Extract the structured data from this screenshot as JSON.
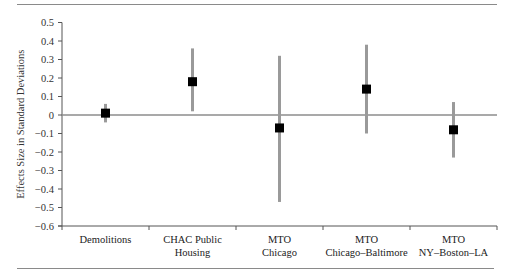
{
  "chart_data": {
    "type": "scatter",
    "subtype": "point-with-error-bars",
    "title": "",
    "xlabel": "",
    "ylabel": "Effects Size in Standard Deviations",
    "ylim": [
      -0.6,
      0.5
    ],
    "yticks": [
      0.5,
      0.4,
      0.3,
      0.2,
      0.1,
      0,
      -0.1,
      -0.2,
      -0.3,
      -0.4,
      -0.5,
      -0.6
    ],
    "ytick_labels": [
      "0.5",
      "0.4",
      "0.3",
      "0.2",
      "0.1",
      "0",
      "−0.1",
      "−0.2",
      "−0.3",
      "−0.4",
      "−0.5",
      "−0.6"
    ],
    "grid": false,
    "legend": null,
    "reference_line": 0,
    "categories": [
      [
        "Demolitions"
      ],
      [
        "CHAC Public",
        "Housing"
      ],
      [
        "MTO",
        "Chicago"
      ],
      [
        "MTO",
        "Chicago–Baltimore"
      ],
      [
        "MTO",
        "NY–Boston–LA"
      ]
    ],
    "category_names": [
      "Demolitions",
      "CHAC Public Housing",
      "MTO Chicago",
      "MTO Chicago–Baltimore",
      "MTO NY–Boston–LA"
    ],
    "series": [
      {
        "name": "Effect size",
        "values": [
          0.01,
          0.18,
          -0.07,
          0.14,
          -0.08
        ],
        "ci_low": [
          -0.04,
          0.02,
          -0.47,
          -0.1,
          -0.23
        ],
        "ci_high": [
          0.06,
          0.36,
          0.32,
          0.38,
          0.07
        ]
      }
    ],
    "colors": {
      "marker": "#000000",
      "error_bar": "#9a9a9a",
      "axis": "#555555",
      "zero_line": "#8c8c8c",
      "frame_rule": "#8a8a8a"
    }
  }
}
